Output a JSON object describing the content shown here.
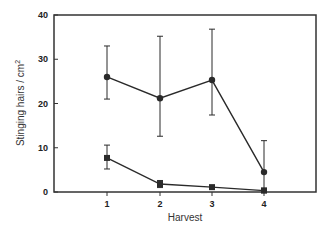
{
  "chart_data": {
    "type": "line",
    "title": "",
    "xlabel": "Harvest",
    "ylabel": "Stinging hairs / cm",
    "ylabel_superscript": "2",
    "categories": [
      "1",
      "2",
      "3",
      "4"
    ],
    "x": [
      1,
      2,
      3,
      4
    ],
    "xlim": [
      0,
      5
    ],
    "ylim": [
      0,
      40
    ],
    "yticks": [
      0,
      10,
      20,
      30,
      40
    ],
    "grid": false,
    "legend": null,
    "series": [
      {
        "name": "circles",
        "marker": "circle",
        "values": [
          26,
          21.2,
          25.3,
          4.5
        ],
        "err_upper": [
          33,
          35.2,
          36.8,
          11.6
        ],
        "err_lower": [
          21,
          12.6,
          17.4,
          0.5
        ]
      },
      {
        "name": "squares",
        "marker": "square",
        "values": [
          7.7,
          1.8,
          1.1,
          0.3
        ],
        "err_upper": [
          10.6,
          2.6,
          1.3,
          0.9
        ],
        "err_lower": [
          5.2,
          1.0,
          0.9,
          0.0
        ]
      }
    ]
  },
  "colors": {
    "line": "#2a2a2a",
    "frame": "#333333",
    "background": "#ffffff"
  }
}
